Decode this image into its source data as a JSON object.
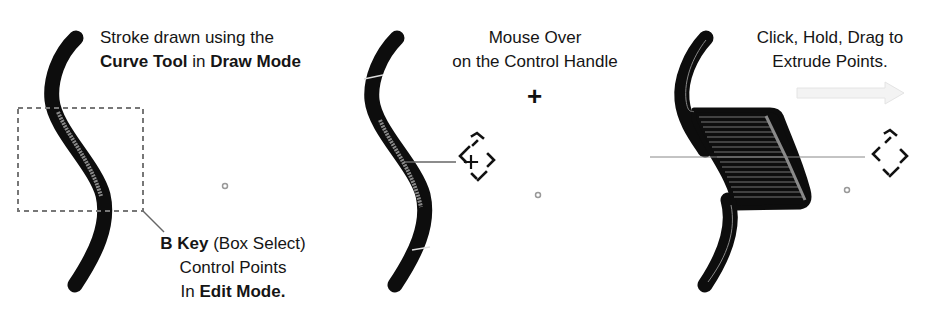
{
  "panels": [
    {
      "id": "draw-stroke",
      "caption_top": {
        "line1": "Stroke drawn using the",
        "line2_parts": [
          {
            "text": "Curve Tool",
            "bold": true
          },
          {
            "text": " in ",
            "bold": false
          },
          {
            "text": "Draw Mode",
            "bold": true
          }
        ]
      },
      "caption_bottom": {
        "line1_parts": [
          {
            "text": "B Key",
            "bold": true
          },
          {
            "text": " (Box Select)",
            "bold": false
          }
        ],
        "line2": "Control Points",
        "line3_parts": [
          {
            "text": "In ",
            "bold": false
          },
          {
            "text": "Edit Mode.",
            "bold": true
          }
        ]
      }
    },
    {
      "id": "mouse-over",
      "caption_top": {
        "line1": "Mouse Over",
        "line2": "on the Control Handle"
      },
      "plus_symbol": "+"
    },
    {
      "id": "extrude",
      "caption_top": {
        "line1": "Click, Hold, Drag to",
        "line2": "Extrude Points."
      }
    }
  ],
  "colors": {
    "stroke": "#0d0d0d",
    "selected_highlight": "#8a8a8a",
    "selection_box": "#777777",
    "leader_line": "#666666",
    "arrow_hint": "#ececec",
    "origin_dot": "#999999"
  }
}
